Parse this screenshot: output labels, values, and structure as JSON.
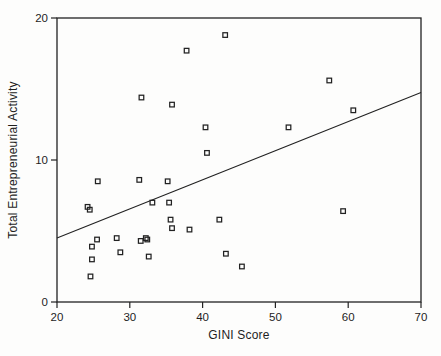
{
  "figure": {
    "background": "#fdfdfc",
    "ink_color": "#222222"
  },
  "chart_data": {
    "type": "scatter",
    "title": "",
    "xlabel": "GINI Score",
    "ylabel": "Total Entrepreneurial Activity",
    "xlim": [
      20,
      70
    ],
    "ylim": [
      0,
      20
    ],
    "x_ticks": [
      "20",
      "30",
      "40",
      "50",
      "60",
      "70"
    ],
    "y_ticks": [
      "0",
      "10",
      "20"
    ],
    "grid": false,
    "legend": "none",
    "marker": "open-square",
    "points": [
      [
        24.2,
        6.7
      ],
      [
        24.5,
        6.5
      ],
      [
        24.6,
        1.8
      ],
      [
        24.8,
        3.0
      ],
      [
        24.8,
        3.9
      ],
      [
        25.5,
        4.4
      ],
      [
        25.6,
        8.5
      ],
      [
        28.2,
        4.5
      ],
      [
        28.7,
        3.5
      ],
      [
        31.3,
        8.6
      ],
      [
        31.5,
        4.3
      ],
      [
        31.6,
        14.4
      ],
      [
        32.2,
        4.5
      ],
      [
        32.4,
        4.4
      ],
      [
        32.6,
        3.2
      ],
      [
        33.1,
        7.0
      ],
      [
        35.2,
        8.5
      ],
      [
        35.4,
        7.0
      ],
      [
        35.6,
        5.8
      ],
      [
        35.8,
        5.2
      ],
      [
        35.8,
        13.9
      ],
      [
        37.8,
        17.7
      ],
      [
        38.2,
        5.1
      ],
      [
        40.4,
        12.3
      ],
      [
        40.6,
        10.5
      ],
      [
        42.3,
        5.8
      ],
      [
        43.1,
        18.8
      ],
      [
        43.2,
        3.4
      ],
      [
        45.4,
        2.5
      ],
      [
        51.8,
        12.3
      ],
      [
        57.4,
        15.6
      ],
      [
        59.3,
        6.4
      ],
      [
        60.7,
        13.5
      ]
    ],
    "trendline": {
      "x1": 20,
      "y1": 4.5,
      "x2": 70,
      "y2": 14.75
    }
  }
}
